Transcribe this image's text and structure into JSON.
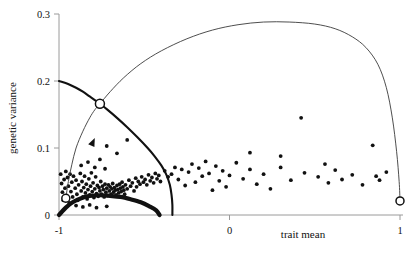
{
  "chart_data": {
    "type": "scatter",
    "title": "",
    "xlabel": "trait mean",
    "ylabel": "genetic variance",
    "xlim": [
      -1.08,
      1.06
    ],
    "ylim": [
      0,
      0.305
    ],
    "xticks": [
      -1,
      0,
      1
    ],
    "xtick_labels": [
      "-1",
      "0",
      "1"
    ],
    "yticks": [
      0,
      0.1,
      0.2,
      0.3
    ],
    "ytick_labels": [
      "0",
      "0.1",
      "0.2",
      "0.3"
    ],
    "grid": false,
    "legend": null,
    "series": [
      {
        "name": "equilibrium boundary (thick)",
        "type": "line",
        "style": "thick-solid",
        "points": [
          [
            -1.0,
            0.2
          ],
          [
            -0.95,
            0.196
          ],
          [
            -0.9,
            0.19
          ],
          [
            -0.86,
            0.184
          ],
          [
            -0.82,
            0.177
          ],
          [
            -0.78,
            0.17
          ],
          [
            -0.76,
            0.166
          ],
          [
            -0.72,
            0.158
          ],
          [
            -0.66,
            0.145
          ],
          [
            -0.6,
            0.131
          ],
          [
            -0.54,
            0.116
          ],
          [
            -0.48,
            0.1
          ],
          [
            -0.44,
            0.088
          ],
          [
            -0.4,
            0.074
          ],
          [
            -0.37,
            0.06
          ],
          [
            -0.35,
            0.045
          ],
          [
            -0.34,
            0.03
          ],
          [
            -0.335,
            0.015
          ],
          [
            -0.335,
            0.0
          ]
        ]
      },
      {
        "name": "lower equilibrium arc (bold)",
        "type": "line",
        "style": "bold-solid",
        "points": [
          [
            -1.0,
            0.0
          ],
          [
            -0.96,
            0.011
          ],
          [
            -0.92,
            0.019
          ],
          [
            -0.87,
            0.025
          ],
          [
            -0.82,
            0.0285
          ],
          [
            -0.76,
            0.0295
          ],
          [
            -0.7,
            0.0285
          ],
          [
            -0.64,
            0.027
          ],
          [
            -0.58,
            0.0235
          ],
          [
            -0.52,
            0.019
          ],
          [
            -0.47,
            0.013
          ],
          [
            -0.43,
            0.007
          ],
          [
            -0.41,
            0.0
          ]
        ]
      },
      {
        "name": "evolutionary trajectory (thin, arrowed)",
        "type": "line",
        "style": "thin-solid",
        "arrow_at": [
          -0.79,
          0.115
        ],
        "points": [
          [
            -0.96,
            0.025
          ],
          [
            -0.945,
            0.05
          ],
          [
            -0.925,
            0.075
          ],
          [
            -0.9,
            0.1
          ],
          [
            -0.86,
            0.125
          ],
          [
            -0.82,
            0.145
          ],
          [
            -0.79,
            0.157
          ],
          [
            -0.76,
            0.166
          ],
          [
            -0.7,
            0.184
          ],
          [
            -0.62,
            0.205
          ],
          [
            -0.52,
            0.226
          ],
          [
            -0.4,
            0.245
          ],
          [
            -0.25,
            0.263
          ],
          [
            -0.1,
            0.276
          ],
          [
            0.05,
            0.284
          ],
          [
            0.2,
            0.288
          ],
          [
            0.35,
            0.288
          ],
          [
            0.5,
            0.285
          ],
          [
            0.62,
            0.278
          ],
          [
            0.72,
            0.266
          ],
          [
            0.8,
            0.25
          ],
          [
            0.87,
            0.225
          ],
          [
            0.92,
            0.19
          ],
          [
            0.955,
            0.145
          ],
          [
            0.98,
            0.095
          ],
          [
            0.995,
            0.05
          ],
          [
            1.0,
            0.021
          ]
        ]
      }
    ],
    "markers": [
      {
        "name": "branch-point",
        "x": -0.76,
        "y": 0.166,
        "style": "open-circle",
        "size": 9
      },
      {
        "name": "lower-left-equilibrium",
        "x": -0.96,
        "y": 0.025,
        "style": "open-circle",
        "size": 8
      },
      {
        "name": "right-equilibrium",
        "x": 1.0,
        "y": 0.021,
        "style": "open-circle",
        "size": 8
      }
    ],
    "scatter_points": [
      [
        -0.99,
        0.061
      ],
      [
        -0.985,
        0.047
      ],
      [
        -0.98,
        0.034
      ],
      [
        -0.975,
        0.022
      ],
      [
        -0.97,
        0.053
      ],
      [
        -0.965,
        0.04
      ],
      [
        -0.96,
        0.065
      ],
      [
        -0.955,
        0.029
      ],
      [
        -0.95,
        0.056
      ],
      [
        -0.945,
        0.043
      ],
      [
        -0.94,
        0.018
      ],
      [
        -0.935,
        0.061
      ],
      [
        -0.93,
        0.035
      ],
      [
        -0.925,
        0.049
      ],
      [
        -0.92,
        0.027
      ],
      [
        -0.915,
        0.058
      ],
      [
        -0.905,
        0.04
      ],
      [
        -0.9,
        0.052
      ],
      [
        -0.895,
        0.031
      ],
      [
        -0.89,
        0.022
      ],
      [
        -0.885,
        0.045
      ],
      [
        -0.875,
        0.062
      ],
      [
        -0.87,
        0.036
      ],
      [
        -0.865,
        0.05
      ],
      [
        -0.86,
        0.027
      ],
      [
        -0.855,
        0.041
      ],
      [
        -0.85,
        0.058
      ],
      [
        -0.845,
        0.033
      ],
      [
        -0.84,
        0.046
      ],
      [
        -0.835,
        0.024
      ],
      [
        -0.83,
        0.038
      ],
      [
        -0.825,
        0.054
      ],
      [
        -0.82,
        0.03
      ],
      [
        -0.815,
        0.043
      ],
      [
        -0.81,
        0.063
      ],
      [
        -0.805,
        0.035
      ],
      [
        -0.8,
        0.048
      ],
      [
        -0.795,
        0.026
      ],
      [
        -0.79,
        0.039
      ],
      [
        -0.785,
        0.057
      ],
      [
        -0.78,
        0.032
      ],
      [
        -0.775,
        0.044
      ],
      [
        -0.77,
        0.028
      ],
      [
        -0.765,
        0.041
      ],
      [
        -0.76,
        0.036
      ],
      [
        -0.755,
        0.05
      ],
      [
        -0.75,
        0.031
      ],
      [
        -0.745,
        0.043
      ],
      [
        -0.74,
        0.038
      ],
      [
        -0.735,
        0.027
      ],
      [
        -0.73,
        0.046
      ],
      [
        -0.725,
        0.034
      ],
      [
        -0.72,
        0.04
      ],
      [
        -0.715,
        0.029
      ],
      [
        -0.71,
        0.045
      ],
      [
        -0.705,
        0.036
      ],
      [
        -0.7,
        0.042
      ],
      [
        -0.695,
        0.031
      ],
      [
        -0.69,
        0.039
      ],
      [
        -0.685,
        0.047
      ],
      [
        -0.68,
        0.034
      ],
      [
        -0.675,
        0.041
      ],
      [
        -0.67,
        0.037
      ],
      [
        -0.665,
        0.03
      ],
      [
        -0.66,
        0.044
      ],
      [
        -0.655,
        0.038
      ],
      [
        -0.65,
        0.033
      ],
      [
        -0.645,
        0.046
      ],
      [
        -0.64,
        0.04
      ],
      [
        -0.635,
        0.035
      ],
      [
        -0.63,
        0.049
      ],
      [
        -0.625,
        0.042
      ],
      [
        -0.62,
        0.037
      ],
      [
        -0.615,
        0.031
      ],
      [
        -0.61,
        0.045
      ],
      [
        -0.6,
        0.039
      ],
      [
        -0.59,
        0.052
      ],
      [
        -0.58,
        0.043
      ],
      [
        -0.57,
        0.048
      ],
      [
        -0.56,
        0.036
      ],
      [
        -0.55,
        0.055
      ],
      [
        -0.545,
        0.042
      ],
      [
        -0.535,
        0.05
      ],
      [
        -0.525,
        0.046
      ],
      [
        -0.515,
        0.057
      ],
      [
        -0.505,
        0.049
      ],
      [
        -0.495,
        0.053
      ],
      [
        -0.485,
        0.045
      ],
      [
        -0.475,
        0.06
      ],
      [
        -0.465,
        0.051
      ],
      [
        -0.455,
        0.056
      ],
      [
        -0.445,
        0.048
      ],
      [
        -0.435,
        0.062
      ],
      [
        -0.425,
        0.054
      ],
      [
        -0.415,
        0.059
      ],
      [
        -0.405,
        0.05
      ],
      [
        -0.87,
        0.074
      ],
      [
        -0.83,
        0.079
      ],
      [
        -0.79,
        0.071
      ],
      [
        -0.76,
        0.083
      ],
      [
        -0.73,
        0.069
      ],
      [
        -0.86,
        0.012
      ],
      [
        -0.82,
        0.015
      ],
      [
        -0.78,
        0.011
      ],
      [
        -0.9,
        0.014
      ],
      [
        -0.72,
        0.013
      ],
      [
        -0.72,
        0.103
      ],
      [
        -0.66,
        0.092
      ],
      [
        -0.6,
        0.112
      ],
      [
        -0.38,
        0.066
      ],
      [
        -0.36,
        0.057
      ],
      [
        -0.34,
        0.061
      ],
      [
        -0.32,
        0.071
      ],
      [
        -0.3,
        0.053
      ],
      [
        -0.28,
        0.068
      ],
      [
        -0.26,
        0.044
      ],
      [
        -0.24,
        0.064
      ],
      [
        -0.22,
        0.076
      ],
      [
        -0.2,
        0.049
      ],
      [
        -0.18,
        0.07
      ],
      [
        -0.16,
        0.058
      ],
      [
        -0.14,
        0.08
      ],
      [
        -0.12,
        0.062
      ],
      [
        -0.1,
        0.037
      ],
      [
        -0.08,
        0.073
      ],
      [
        -0.06,
        0.051
      ],
      [
        -0.04,
        0.066
      ],
      [
        -0.02,
        0.042
      ],
      [
        0.0,
        0.059
      ],
      [
        0.04,
        0.078
      ],
      [
        0.08,
        0.054
      ],
      [
        0.12,
        0.068
      ],
      [
        0.16,
        0.046
      ],
      [
        0.2,
        0.061
      ],
      [
        0.24,
        0.039
      ],
      [
        0.3,
        0.071
      ],
      [
        0.36,
        0.052
      ],
      [
        0.42,
        0.145
      ],
      [
        0.44,
        0.063
      ],
      [
        0.52,
        0.057
      ],
      [
        0.58,
        0.048
      ],
      [
        0.62,
        0.067
      ],
      [
        0.66,
        0.053
      ],
      [
        0.72,
        0.06
      ],
      [
        0.78,
        0.045
      ],
      [
        0.84,
        0.104
      ],
      [
        0.86,
        0.058
      ],
      [
        0.88,
        0.052
      ],
      [
        0.92,
        0.064
      ],
      [
        0.3,
        0.088
      ],
      [
        0.12,
        0.093
      ],
      [
        0.56,
        0.076
      ]
    ]
  }
}
